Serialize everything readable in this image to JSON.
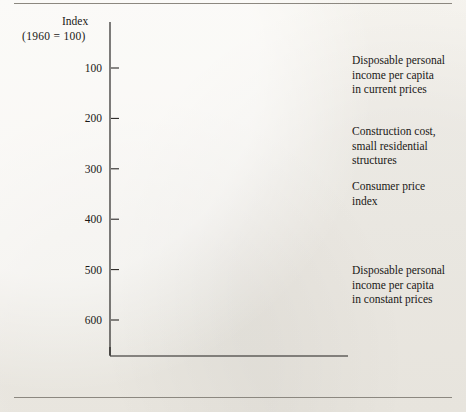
{
  "axis": {
    "y_caption_line1": "Index",
    "y_caption_line2": "(1960 = 100)",
    "y_ticks": [
      "600",
      "500",
      "400",
      "300",
      "200",
      "100"
    ],
    "x_ticks": [
      "1960",
      "1970",
      "1980",
      "1985"
    ]
  },
  "labels": {
    "dpi_current": [
      "Disposable personal",
      "income per capita",
      "in current prices"
    ],
    "construction_cost": [
      "Construction cost,",
      "small residential",
      "structures"
    ],
    "cpi": [
      "Consumer price",
      "index"
    ],
    "dpi_constant": [
      "Disposable personal",
      "income per capita",
      "in constant prices"
    ]
  },
  "colors": {
    "ink": "#141210",
    "paper": "#f4f2ed",
    "rule": "#8c8880"
  },
  "chart_data": {
    "type": "line",
    "title": "",
    "xlabel": "",
    "ylabel": "Index (1960 = 100)",
    "x": [
      1960,
      1970,
      1985
    ],
    "x_tick_labels": [
      "1960",
      "1970",
      "1980",
      "1985"
    ],
    "x_tick_values": [
      1960,
      1970,
      1980,
      1985
    ],
    "xlim": [
      1960,
      1985
    ],
    "ylim": [
      60,
      640
    ],
    "y_tick_values": [
      100,
      200,
      300,
      400,
      500,
      600
    ],
    "grid": false,
    "legend": "inline-right-of-line-ends",
    "series": [
      {
        "name": "Disposable personal income per capita in current prices",
        "values": [
          100,
          175,
          590
        ]
      },
      {
        "name": "Construction cost, small residential structures",
        "values": [
          100,
          145,
          440
        ]
      },
      {
        "name": "Consumer price index",
        "values": [
          100,
          133,
          355
        ]
      },
      {
        "name": "Disposable personal income per capita in constant prices",
        "values": [
          100,
          140,
          165
        ]
      }
    ]
  }
}
